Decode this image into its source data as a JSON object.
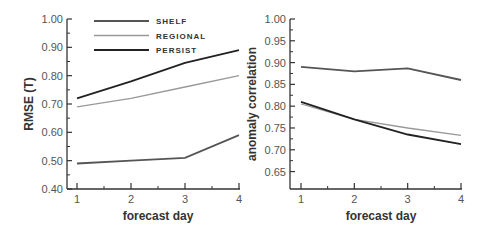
{
  "chart_data": [
    {
      "type": "line",
      "title": "",
      "xlabel": "forecast day",
      "ylabel": "RMSE (T)",
      "x": [
        1,
        2,
        3,
        4
      ],
      "xticks": [
        "1",
        "2",
        "3",
        "4"
      ],
      "yticks": [
        "0.40",
        "0.50",
        "0.60",
        "0.70",
        "0.80",
        "0.90",
        "1.00"
      ],
      "ylim": [
        0.4,
        1.0
      ],
      "grid": false,
      "legend_position": "top-left inside",
      "series": [
        {
          "name": "SHELF",
          "color": "#555555",
          "values": [
            0.49,
            0.5,
            0.51,
            0.59
          ]
        },
        {
          "name": "REGIONAL",
          "color": "#999999",
          "values": [
            0.69,
            0.72,
            0.76,
            0.8
          ]
        },
        {
          "name": "PERSIST",
          "color": "#222222",
          "values": [
            0.72,
            0.78,
            0.845,
            0.89
          ]
        }
      ]
    },
    {
      "type": "line",
      "title": "",
      "xlabel": "forecast day",
      "ylabel": "anomaly correlation",
      "x": [
        1,
        2,
        3,
        4
      ],
      "xticks": [
        "1",
        "2",
        "3",
        "4"
      ],
      "yticks": [
        "0.65",
        "0.70",
        "0.75",
        "0.80",
        "0.85",
        "0.90",
        "0.95",
        "1.00"
      ],
      "ylim": [
        0.61,
        1.0
      ],
      "grid": false,
      "series": [
        {
          "name": "SHELF",
          "color": "#555555",
          "values": [
            0.89,
            0.88,
            0.887,
            0.86
          ]
        },
        {
          "name": "REGIONAL",
          "color": "#999999",
          "values": [
            0.805,
            0.77,
            0.75,
            0.733
          ]
        },
        {
          "name": "PERSIST",
          "color": "#222222",
          "values": [
            0.81,
            0.77,
            0.735,
            0.713
          ]
        }
      ]
    }
  ]
}
